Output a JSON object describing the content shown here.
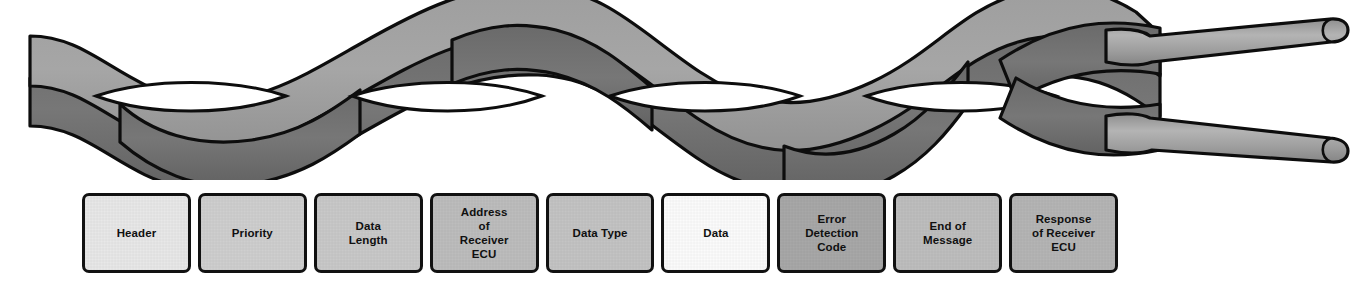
{
  "figure": {
    "title": "",
    "illustration": {
      "name": "twisted-pair-wire",
      "description": "Twisted pair of wires with two separated rounded conductor ends at right",
      "wire_light_color": "#9a9a9a",
      "wire_dark_color": "#6e6e6e",
      "outline_color": "#0d0d0d",
      "twist_count": 4,
      "separated_ends": 2
    },
    "frame": {
      "name": "message-frame",
      "border_color": "#111111",
      "text_color": "#101010",
      "fields": [
        {
          "label": "Header",
          "fill": "#e8e8e8"
        },
        {
          "label": "Priority",
          "fill": "#cfcfcf"
        },
        {
          "label": "Data\nLength",
          "fill": "#c9c9c9"
        },
        {
          "label": "Address\nof\nReceiver\nECU",
          "fill": "#bdbdbd"
        },
        {
          "label": "Data Type",
          "fill": "#c4c4c4"
        },
        {
          "label": "Data",
          "fill": "#fbfbfb"
        },
        {
          "label": "Error\nDetection\nCode",
          "fill": "#a8a8a8"
        },
        {
          "label": "End of\nMessage",
          "fill": "#bebebe"
        },
        {
          "label": "Response\nof Receiver\nECU",
          "fill": "#b5b5b5"
        }
      ]
    }
  }
}
